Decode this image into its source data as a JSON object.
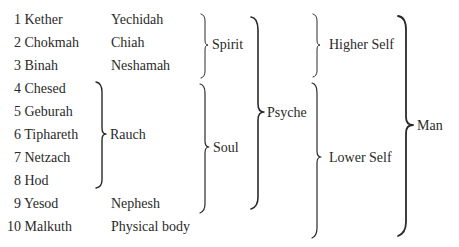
{
  "sephiroth": [
    {
      "num": "1",
      "name": "Kether",
      "soul_part": "Yechidah"
    },
    {
      "num": "2",
      "name": "Chokmah",
      "soul_part": "Chiah"
    },
    {
      "num": "3",
      "name": "Binah",
      "soul_part": "Neshamah"
    },
    {
      "num": "4",
      "name": "Chesed",
      "soul_part": ""
    },
    {
      "num": "5",
      "name": "Geburah",
      "soul_part": ""
    },
    {
      "num": "6",
      "name": "Tiphareth",
      "soul_part": "Rauch"
    },
    {
      "num": "7",
      "name": "Netzach",
      "soul_part": ""
    },
    {
      "num": "8",
      "name": "Hod",
      "soul_part": ""
    },
    {
      "num": "9",
      "name": "Yesod",
      "soul_part": "Nephesh"
    },
    {
      "num": "10",
      "name": "Malkuth",
      "soul_part": "Physical body"
    }
  ],
  "groups": {
    "spirit": "Spirit",
    "soul": "Soul",
    "psyche": "Psyche",
    "higher_self": "Higher Self",
    "lower_self": "Lower Self",
    "man": "Man"
  },
  "colors": {
    "text": "#2a2a2a",
    "background": "#ffffff"
  }
}
